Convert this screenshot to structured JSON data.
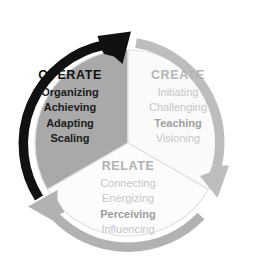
{
  "diagram": {
    "type": "cycle",
    "title": "",
    "center": {
      "x": 128,
      "y": 143
    },
    "segments": [
      {
        "id": "operate",
        "title": "OPERATE",
        "emphasis": "dark",
        "arc_color": "#111111",
        "fill_color": "#a9a9a9",
        "items": [
          {
            "label": "Organizing",
            "bold": true
          },
          {
            "label": "Achieving",
            "bold": true
          },
          {
            "label": "Adapting",
            "bold": true
          },
          {
            "label": "Scaling",
            "bold": true
          }
        ]
      },
      {
        "id": "create",
        "title": "CREATE",
        "emphasis": "light",
        "arc_color": "#bdbdbd",
        "fill_color": "#fafafa",
        "items": [
          {
            "label": "Initiating",
            "bold": false
          },
          {
            "label": "Challenging",
            "bold": false
          },
          {
            "label": "Teaching",
            "bold": true
          },
          {
            "label": "Visioning",
            "bold": false
          }
        ]
      },
      {
        "id": "relate",
        "title": "RELATE",
        "emphasis": "light",
        "arc_color": "#b2b2b2",
        "fill_color": "#fcfcfc",
        "items": [
          {
            "label": "Connecting",
            "bold": false
          },
          {
            "label": "Energizing",
            "bold": false
          },
          {
            "label": "Perceiving",
            "bold": true
          },
          {
            "label": "Influencing",
            "bold": false
          }
        ]
      }
    ],
    "arrows": [
      {
        "id": "operate-arrow",
        "direction": "clockwise",
        "head_position": "top",
        "color": "#111111"
      },
      {
        "id": "create-arrow",
        "direction": "clockwise",
        "head_position": "bottom-right",
        "color": "#bdbdbd"
      },
      {
        "id": "relate-arrow",
        "direction": "clockwise",
        "head_position": "bottom-left",
        "color": "#b2b2b2"
      }
    ],
    "colors": {
      "background": "#ffffff",
      "operate_dark": "#111111",
      "operate_fill": "#a9a9a9",
      "create_gray": "#bdbdbd",
      "relate_gray": "#b2b2b2",
      "wedge_outline": "#dcdcdc"
    }
  }
}
